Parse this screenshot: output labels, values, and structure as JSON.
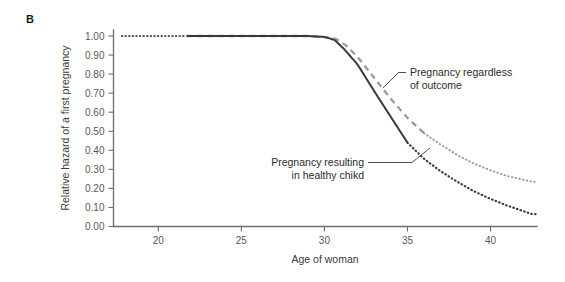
{
  "figure": {
    "panel_label": "B",
    "background_color": "#ffffff"
  },
  "chart_data": {
    "type": "line",
    "title": "",
    "subtitle": "",
    "xlabel": "Age of woman",
    "ylabel": "Relative hazard of a first pregnancy",
    "xlim": [
      17.3,
      42.8
    ],
    "ylim": [
      0.0,
      1.0
    ],
    "grid": false,
    "legend_position": "inline-annotations",
    "xticks": [
      20,
      25,
      30,
      35,
      40
    ],
    "xtick_labels": [
      "20",
      "25",
      "30",
      "35",
      "40"
    ],
    "yticks": [
      0.0,
      0.1,
      0.2,
      0.3,
      0.4,
      0.5,
      0.6,
      0.7,
      0.8,
      0.9,
      1.0
    ],
    "ytick_labels": [
      "0.00",
      "0.10",
      "0.20",
      "0.30",
      "0.40",
      "0.50",
      "0.60",
      "0.70",
      "0.80",
      "0.90",
      "1.00"
    ],
    "series": [
      {
        "name": "Pregnancy regardless of outcome",
        "color": "#9a9a9c",
        "style": "dashed-then-dotted",
        "observed_from": 21.7,
        "observed_to": 36.0,
        "x": [
          17.8,
          19.0,
          20.0,
          21.0,
          21.7,
          23.0,
          25.0,
          27.0,
          29.0,
          30.0,
          30.7,
          31.3,
          32.0,
          33.0,
          34.0,
          35.0,
          36.0,
          37.0,
          38.0,
          39.0,
          40.0,
          41.0,
          42.0,
          42.5
        ],
        "values": [
          1.0,
          1.0,
          1.0,
          1.0,
          1.0,
          1.0,
          1.0,
          1.0,
          1.0,
          0.995,
          0.985,
          0.95,
          0.89,
          0.78,
          0.67,
          0.57,
          0.49,
          0.43,
          0.375,
          0.33,
          0.295,
          0.265,
          0.245,
          0.235
        ]
      },
      {
        "name": "Pregnancy resulting in healthy chikd",
        "color": "#3a3a3c",
        "style": "solid-then-dotted",
        "observed_from": 21.7,
        "observed_to": 35.0,
        "x": [
          17.8,
          19.0,
          20.0,
          21.0,
          21.7,
          23.0,
          25.0,
          27.0,
          29.0,
          30.0,
          30.6,
          31.2,
          32.0,
          33.0,
          34.0,
          35.0,
          36.0,
          37.0,
          38.0,
          39.0,
          40.0,
          41.0,
          42.0,
          42.5
        ],
        "values": [
          1.0,
          1.0,
          1.0,
          1.0,
          1.0,
          1.0,
          1.0,
          1.0,
          1.0,
          0.995,
          0.98,
          0.93,
          0.85,
          0.71,
          0.575,
          0.44,
          0.355,
          0.29,
          0.235,
          0.185,
          0.145,
          0.11,
          0.08,
          0.065
        ]
      }
    ],
    "annotations": [
      {
        "id": "upper",
        "text_line_1": "Pregnancy regardless",
        "text_line_2": "of outcome",
        "points_to_series": "Pregnancy regardless of outcome"
      },
      {
        "id": "lower",
        "text_line_1": "Pregnancy resulting",
        "text_line_2": "in healthy chikd",
        "points_to_series": "Pregnancy resulting in healthy chikd"
      }
    ]
  }
}
